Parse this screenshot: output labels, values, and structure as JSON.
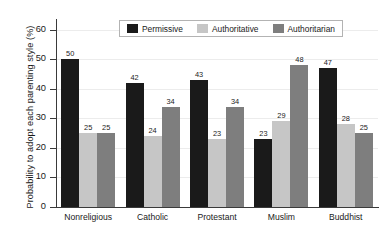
{
  "chart_data": {
    "type": "bar",
    "title": "",
    "subtitle": "",
    "xlabel": "",
    "ylabel": "Probability to adopt each parenting style (%)",
    "categories": [
      "Nonreligious",
      "Catholic",
      "Protestant",
      "Muslim",
      "Buddhist"
    ],
    "series": [
      {
        "name": "Permissive",
        "color": "#1a1a1a",
        "values": [
          50,
          42,
          43,
          23,
          47
        ]
      },
      {
        "name": "Authoritative",
        "color": "#c6c6c6",
        "values": [
          25,
          24,
          23,
          29,
          28
        ]
      },
      {
        "name": "Authoritarian",
        "color": "#7e7e7e",
        "values": [
          25,
          34,
          34,
          48,
          25
        ]
      }
    ],
    "ylim": [
      0,
      63
    ],
    "yticks": [
      0,
      10,
      20,
      30,
      40,
      50,
      60
    ],
    "ytick_labels": [
      "0",
      "10",
      "20",
      "30",
      "40",
      "50",
      "60"
    ],
    "grid": "horizontal-light",
    "legend_position": "top-center",
    "data_labels": true
  },
  "legend": {
    "entries": [
      {
        "label": "Permissive"
      },
      {
        "label": "Authoritative"
      },
      {
        "label": "Authoritarian"
      }
    ]
  }
}
